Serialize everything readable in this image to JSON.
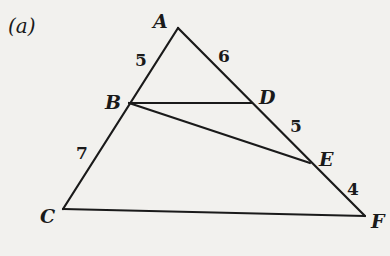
{
  "part_label": "(a)",
  "vertices": {
    "A": {
      "label": "A",
      "x": 178,
      "y": 28
    },
    "B": {
      "label": "B",
      "x": 129,
      "y": 103
    },
    "C": {
      "label": "C",
      "x": 63,
      "y": 209
    },
    "D": {
      "label": "D",
      "x": 252,
      "y": 103
    },
    "E": {
      "label": "E",
      "x": 310,
      "y": 163
    },
    "F": {
      "label": "F",
      "x": 365,
      "y": 216
    }
  },
  "segments": [
    {
      "from": "A",
      "to": "C",
      "name": "side-AC"
    },
    {
      "from": "A",
      "to": "F",
      "name": "side-AF"
    },
    {
      "from": "C",
      "to": "F",
      "name": "side-CF"
    },
    {
      "from": "B",
      "to": "D",
      "name": "segment-BD"
    },
    {
      "from": "B",
      "to": "E",
      "name": "segment-BE"
    }
  ],
  "lengths": {
    "AB": "5",
    "AD": "6",
    "BC": "7",
    "DE": "5",
    "EF": "4"
  },
  "colors": {
    "background": "#f2f1ee",
    "ink": "#1a1a1a"
  }
}
